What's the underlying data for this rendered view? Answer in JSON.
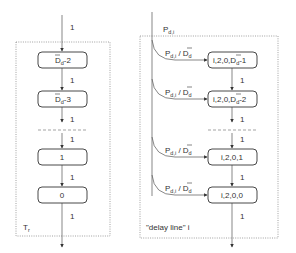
{
  "left_chain": {
    "container_label": "T",
    "container_label_sub": "r",
    "input_rate": "1",
    "states": [
      {
        "text": "D",
        "sub": "d",
        "suffix": "-2",
        "overbar": true
      },
      {
        "text": "D",
        "sub": "d",
        "suffix": "-3",
        "overbar": true
      },
      {
        "text": "1",
        "sub": "",
        "suffix": "",
        "overbar": false
      },
      {
        "text": "0",
        "sub": "",
        "suffix": "",
        "overbar": false
      }
    ],
    "transition_rates": [
      "1",
      "1",
      "1",
      "1",
      "1"
    ]
  },
  "right_chain": {
    "container_label": "\"delay line\" i",
    "input_label": "P",
    "input_label_sub": "d,i",
    "branch_label": {
      "num": "P",
      "num_sub": "d,i",
      "sep": " / ",
      "den": "D",
      "den_sub": "d"
    },
    "states": [
      {
        "prefix": "i,2,0,",
        "bar": "D",
        "sub": "d",
        "suffix": "-1"
      },
      {
        "prefix": "i,2,0,",
        "bar": "D",
        "sub": "d",
        "suffix": "-2"
      },
      {
        "prefix": "i,2,0,1",
        "bar": "",
        "sub": "",
        "suffix": ""
      },
      {
        "prefix": "i,2,0,0",
        "bar": "",
        "sub": "",
        "suffix": ""
      }
    ],
    "transition_rates": [
      "1",
      "1",
      "1",
      "1"
    ]
  }
}
